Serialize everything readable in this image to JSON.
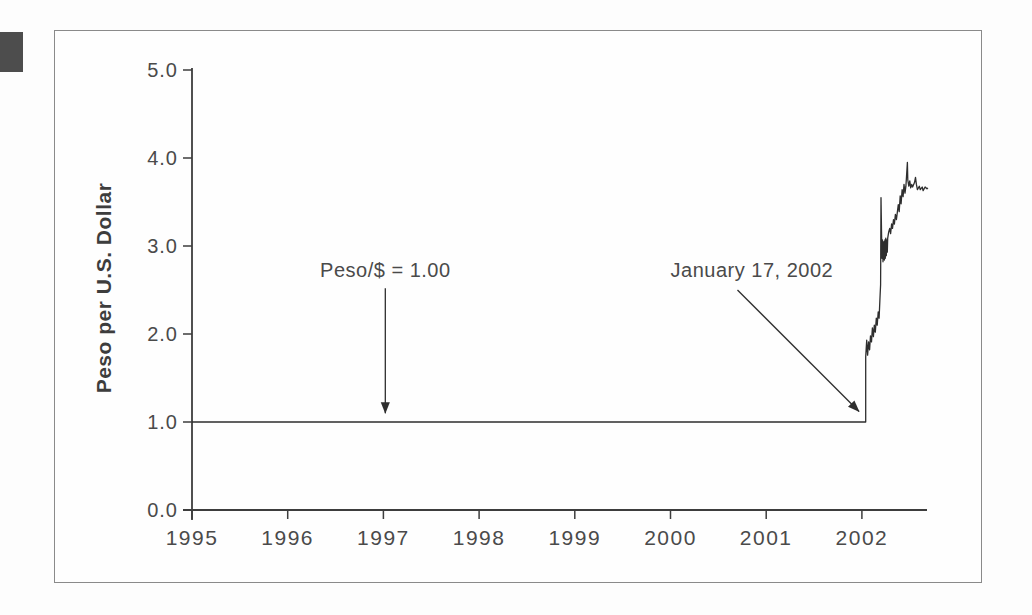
{
  "page": {
    "background": "#fdfdfd",
    "corner_mark_color": "#4d4d4d",
    "frame_border_color": "#8a8a8a"
  },
  "chart_data": {
    "type": "line",
    "title": "",
    "xlabel": "",
    "ylabel": "Peso per U.S. Dollar",
    "xlim": [
      1995,
      2002.72
    ],
    "ylim": [
      0,
      5
    ],
    "grid": false,
    "legend": "none",
    "axis_color": "#3d3d3d",
    "line_color": "#2e2e2e",
    "x_ticks": [
      {
        "value": 1995,
        "label": "1995"
      },
      {
        "value": 1996,
        "label": "1996"
      },
      {
        "value": 1997,
        "label": "1997"
      },
      {
        "value": 1998,
        "label": "1998"
      },
      {
        "value": 1999,
        "label": "1999"
      },
      {
        "value": 2000,
        "label": "2000"
      },
      {
        "value": 2001,
        "label": "2001"
      },
      {
        "value": 2002,
        "label": "2002"
      }
    ],
    "y_ticks": [
      {
        "value": 0,
        "label": "0.0"
      },
      {
        "value": 1,
        "label": "1.0"
      },
      {
        "value": 2,
        "label": "2.0"
      },
      {
        "value": 3,
        "label": "3.0"
      },
      {
        "value": 4,
        "label": "4.0"
      },
      {
        "value": 5,
        "label": "5.0"
      }
    ],
    "series": [
      {
        "name": "Peso per U.S. Dollar",
        "color": "#2e2e2e",
        "points": [
          [
            1995.0,
            1.0
          ],
          [
            2002.04,
            1.0
          ],
          [
            2002.04,
            1.74
          ],
          [
            2002.05,
            1.93
          ],
          [
            2002.06,
            1.76
          ],
          [
            2002.07,
            1.91
          ],
          [
            2002.08,
            1.82
          ],
          [
            2002.09,
            1.98
          ],
          [
            2002.1,
            1.91
          ],
          [
            2002.11,
            2.07
          ],
          [
            2002.12,
            1.97
          ],
          [
            2002.13,
            2.1
          ],
          [
            2002.14,
            2.02
          ],
          [
            2002.15,
            2.18
          ],
          [
            2002.16,
            2.1
          ],
          [
            2002.17,
            2.25
          ],
          [
            2002.18,
            2.18
          ],
          [
            2002.19,
            2.44
          ],
          [
            2002.195,
            2.56
          ],
          [
            2002.2,
            3.55
          ],
          [
            2002.205,
            3.18
          ],
          [
            2002.21,
            2.86
          ],
          [
            2002.215,
            3.07
          ],
          [
            2002.22,
            2.82
          ],
          [
            2002.23,
            3.05
          ],
          [
            2002.235,
            2.84
          ],
          [
            2002.24,
            3.07
          ],
          [
            2002.245,
            2.86
          ],
          [
            2002.25,
            3.09
          ],
          [
            2002.255,
            2.89
          ],
          [
            2002.26,
            3.07
          ],
          [
            2002.265,
            2.93
          ],
          [
            2002.27,
            3.09
          ],
          [
            2002.28,
            3.16
          ],
          [
            2002.29,
            3.2
          ],
          [
            2002.3,
            3.14
          ],
          [
            2002.31,
            3.25
          ],
          [
            2002.32,
            3.2
          ],
          [
            2002.33,
            3.3
          ],
          [
            2002.34,
            3.25
          ],
          [
            2002.35,
            3.36
          ],
          [
            2002.36,
            3.3
          ],
          [
            2002.38,
            3.47
          ],
          [
            2002.39,
            3.39
          ],
          [
            2002.4,
            3.57
          ],
          [
            2002.41,
            3.48
          ],
          [
            2002.42,
            3.64
          ],
          [
            2002.43,
            3.56
          ],
          [
            2002.44,
            3.7
          ],
          [
            2002.45,
            3.6
          ],
          [
            2002.46,
            3.68
          ],
          [
            2002.47,
            3.86
          ],
          [
            2002.475,
            3.95
          ],
          [
            2002.48,
            3.75
          ],
          [
            2002.49,
            3.68
          ],
          [
            2002.5,
            3.74
          ],
          [
            2002.51,
            3.66
          ],
          [
            2002.52,
            3.7
          ],
          [
            2002.53,
            3.67
          ],
          [
            2002.55,
            3.72
          ],
          [
            2002.56,
            3.78
          ],
          [
            2002.57,
            3.7
          ],
          [
            2002.58,
            3.64
          ],
          [
            2002.6,
            3.68
          ],
          [
            2002.61,
            3.64
          ],
          [
            2002.63,
            3.67
          ],
          [
            2002.64,
            3.63
          ],
          [
            2002.66,
            3.67
          ],
          [
            2002.68,
            3.65
          ],
          [
            2002.69,
            3.66
          ]
        ]
      }
    ],
    "annotations": [
      {
        "id": "peg",
        "label": "Peso/$ = 1.00",
        "text_at": [
          1997.02,
          2.73
        ],
        "arrow_from": [
          1997.02,
          2.52
        ],
        "arrow_to": [
          1997.02,
          1.1
        ]
      },
      {
        "id": "devaluation",
        "label": "January 17, 2002",
        "text_at": [
          2000.85,
          2.73
        ],
        "arrow_from": [
          2000.7,
          2.5
        ],
        "arrow_to": [
          2001.97,
          1.12
        ]
      }
    ]
  }
}
